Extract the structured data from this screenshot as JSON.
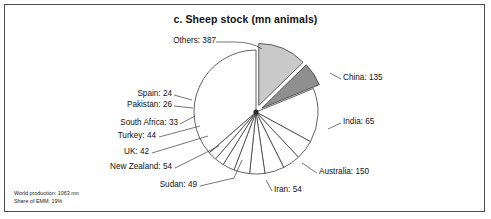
{
  "chart_data": {
    "type": "pie",
    "title": "c. Sheep stock (mn animals)",
    "unit": "mn animals",
    "categories": [
      "China",
      "India",
      "Australia",
      "Iran",
      "Sudan",
      "New Zealand",
      "UK",
      "Turkey",
      "South Africa",
      "Pakistan",
      "Spain",
      "Others"
    ],
    "values": [
      135,
      65,
      150,
      54,
      49,
      54,
      42,
      44,
      33,
      26,
      24,
      387
    ],
    "total": 1063,
    "legend": "none",
    "grid": false,
    "xlabel": "",
    "ylabel": "",
    "slices": [
      {
        "name": "China",
        "label": "China: 135",
        "value": 135,
        "color": "#c9c9c9",
        "exploded": true,
        "label_side": "right"
      },
      {
        "name": "India",
        "label": "India: 65",
        "value": 65,
        "color": "#8f8f8f",
        "exploded": true,
        "label_side": "right"
      },
      {
        "name": "Australia",
        "label": "Australia: 150",
        "value": 150,
        "color": "#ffffff",
        "exploded": false,
        "label_side": "right"
      },
      {
        "name": "Iran",
        "label": "Iran: 54",
        "value": 54,
        "color": "#ffffff",
        "exploded": false,
        "label_side": "right"
      },
      {
        "name": "Sudan",
        "label": "Sudan: 49",
        "value": 49,
        "color": "#ffffff",
        "exploded": false,
        "label_side": "left"
      },
      {
        "name": "New Zealand",
        "label": "New Zealand: 54",
        "value": 54,
        "color": "#ffffff",
        "exploded": false,
        "label_side": "left"
      },
      {
        "name": "UK",
        "label": "UK: 42",
        "value": 42,
        "color": "#ffffff",
        "exploded": false,
        "label_side": "left"
      },
      {
        "name": "Turkey",
        "label": "Turkey: 44",
        "value": 44,
        "color": "#ffffff",
        "exploded": false,
        "label_side": "left"
      },
      {
        "name": "South Africa",
        "label": "South Africa: 33",
        "value": 33,
        "color": "#ffffff",
        "exploded": false,
        "label_side": "left"
      },
      {
        "name": "Pakistan",
        "label": "Pakistan: 26",
        "value": 26,
        "color": "#ffffff",
        "exploded": false,
        "label_side": "left"
      },
      {
        "name": "Spain",
        "label": "Spain: 24",
        "value": 24,
        "color": "#ffffff",
        "exploded": false,
        "label_side": "left"
      },
      {
        "name": "Others",
        "label": "Others: 387",
        "value": 387,
        "color": "#ffffff",
        "exploded": false,
        "label_side": "left"
      }
    ]
  },
  "labels": {
    "china": "China: 135",
    "india": "India: 65",
    "australia": "Australia: 150",
    "iran": "Iran: 54",
    "sudan": "Sudan: 49",
    "new_zealand": "New Zealand: 54",
    "uk": "UK: 42",
    "turkey": "Turkey: 44",
    "south_africa": "South Africa: 33",
    "pakistan": "Pakistan: 26",
    "spain": "Spain: 24",
    "others": "Others: 387"
  },
  "footnote": {
    "line1": "World production: 1063 mn",
    "line2": "Share of EMM: 19%"
  },
  "colors": {
    "china_fill": "#c9c9c9",
    "india_fill": "#8f8f8f",
    "slice_fill": "#ffffff",
    "stroke": "#3b3b3b",
    "frame": "#4a4a4a",
    "text": "#111111"
  }
}
